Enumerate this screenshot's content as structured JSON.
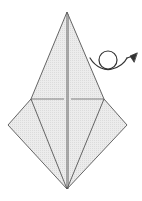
{
  "diagram": {
    "type": "origami-step",
    "colors": {
      "background": "#ffffff",
      "paper_fill": "#e9e9e9",
      "stroke": "#555555",
      "arrow": "#333333"
    },
    "points": {
      "apex": [
        67,
        12
      ],
      "left_shoulder": [
        31,
        99
      ],
      "right_shoulder": [
        104,
        99
      ],
      "left_wing": [
        8,
        125
      ],
      "right_wing": [
        127,
        125
      ],
      "bottom": [
        67,
        189
      ]
    },
    "symbols": [
      {
        "name": "turn-over-arrow",
        "meaning": "turn the model over"
      }
    ]
  }
}
